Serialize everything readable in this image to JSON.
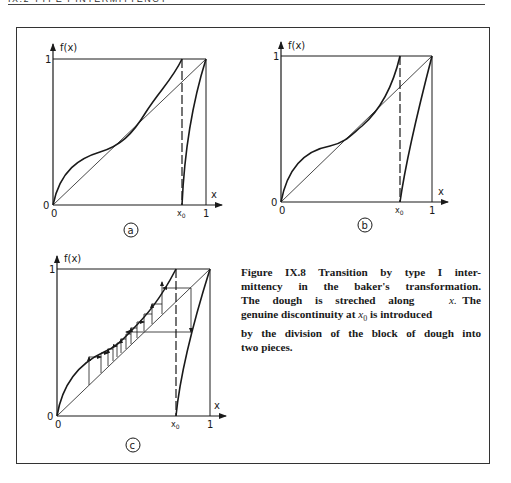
{
  "header": {
    "running_head": "IX.2   TYPE I INTERMITTENCY"
  },
  "figure": {
    "panels": [
      {
        "id": "a",
        "circle_label": "a",
        "y_axis_label": "f(x)",
        "x_axis_label": "x",
        "tick_y_top": "1",
        "tick_y_origin": "0",
        "tick_x_origin": "0",
        "tick_x0": "x0",
        "tick_x_one": "1",
        "description": "Left branch crosses diagonal at two points (two fixed points)"
      },
      {
        "id": "b",
        "circle_label": "b",
        "y_axis_label": "f(x)",
        "x_axis_label": "x",
        "tick_y_top": "1",
        "tick_y_origin": "0",
        "tick_x_origin": "0",
        "tick_x0": "x0",
        "tick_x_one": "1",
        "description": "Left branch tangent to diagonal (saddle-node)"
      },
      {
        "id": "c",
        "circle_label": "c",
        "y_axis_label": "f(x)",
        "x_axis_label": "x",
        "tick_y_top": "1",
        "tick_y_origin": "0",
        "tick_x_origin": "0",
        "tick_x0": "x0",
        "tick_x_one": "1",
        "description": "Left branch just above diagonal with cobweb iteration through narrow channel"
      }
    ],
    "caption": {
      "lines": [
        "Figure IX.8   Transition by type I inter-",
        "mittency in the baker's transformation.",
        "The dough is streched along",
        "The",
        "genuine discontinuity at",
        "is introduced",
        "by the division of the block of dough into",
        "two pieces."
      ],
      "var_x": "x.",
      "var_x0": "x",
      "var_x0_sub": "0"
    }
  }
}
